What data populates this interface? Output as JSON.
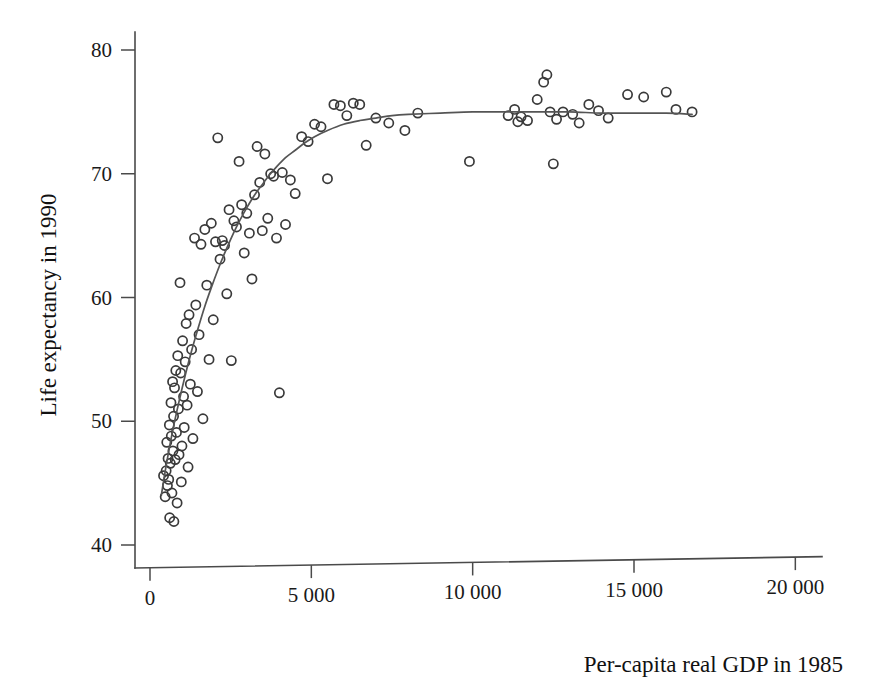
{
  "chart_data": {
    "type": "scatter",
    "title": "",
    "xlabel": "Per-capita real GDP in 1985",
    "ylabel": "Life expectancy in 1990",
    "xlim": [
      0,
      21500
    ],
    "ylim": [
      38.5,
      81.5
    ],
    "xticks": [
      0,
      5000,
      10000,
      15000,
      20000
    ],
    "xticklabels": [
      "0",
      "5 000",
      "10 000",
      "15 000",
      "20 000"
    ],
    "yticks": [
      40,
      50,
      60,
      70,
      80
    ],
    "yticklabels": [
      "40",
      "50",
      "60",
      "70",
      "80"
    ],
    "grid": false,
    "legend": null,
    "marker": "open-circle",
    "point_color": "#3a3a3a",
    "curve_color": "#555555",
    "axis_color": "#4a4a4a",
    "series": [
      {
        "name": "Countries",
        "points": [
          [
            420,
            45.6
          ],
          [
            470,
            43.9
          ],
          [
            500,
            46.0
          ],
          [
            520,
            48.3
          ],
          [
            540,
            44.8
          ],
          [
            560,
            47.0
          ],
          [
            580,
            45.3
          ],
          [
            600,
            49.7
          ],
          [
            610,
            42.2
          ],
          [
            630,
            46.6
          ],
          [
            650,
            51.5
          ],
          [
            660,
            48.8
          ],
          [
            680,
            44.2
          ],
          [
            700,
            53.2
          ],
          [
            710,
            47.6
          ],
          [
            730,
            50.4
          ],
          [
            740,
            41.9
          ],
          [
            760,
            52.7
          ],
          [
            780,
            46.9
          ],
          [
            800,
            54.1
          ],
          [
            820,
            49.1
          ],
          [
            840,
            43.4
          ],
          [
            860,
            55.3
          ],
          [
            880,
            51.0
          ],
          [
            900,
            47.3
          ],
          [
            930,
            61.2
          ],
          [
            950,
            53.9
          ],
          [
            970,
            45.1
          ],
          [
            990,
            48.0
          ],
          [
            1010,
            56.5
          ],
          [
            1040,
            52.0
          ],
          [
            1060,
            49.5
          ],
          [
            1090,
            54.8
          ],
          [
            1120,
            57.9
          ],
          [
            1150,
            51.3
          ],
          [
            1180,
            46.3
          ],
          [
            1210,
            58.6
          ],
          [
            1250,
            53.0
          ],
          [
            1290,
            55.8
          ],
          [
            1330,
            48.6
          ],
          [
            1380,
            64.8
          ],
          [
            1420,
            59.4
          ],
          [
            1470,
            52.4
          ],
          [
            1520,
            57.0
          ],
          [
            1580,
            64.3
          ],
          [
            1640,
            50.2
          ],
          [
            1700,
            65.5
          ],
          [
            1760,
            61.0
          ],
          [
            1830,
            55.0
          ],
          [
            1900,
            66.0
          ],
          [
            1960,
            58.2
          ],
          [
            2030,
            64.5
          ],
          [
            2100,
            72.9
          ],
          [
            2170,
            63.1
          ],
          [
            2240,
            64.6
          ],
          [
            2310,
            64.2
          ],
          [
            2380,
            60.3
          ],
          [
            2450,
            67.1
          ],
          [
            2520,
            54.9
          ],
          [
            2600,
            66.2
          ],
          [
            2680,
            65.7
          ],
          [
            2760,
            71.0
          ],
          [
            2840,
            67.5
          ],
          [
            2920,
            63.6
          ],
          [
            3000,
            66.8
          ],
          [
            3080,
            65.2
          ],
          [
            3160,
            61.5
          ],
          [
            3240,
            68.3
          ],
          [
            3320,
            72.2
          ],
          [
            3400,
            69.3
          ],
          [
            3480,
            65.4
          ],
          [
            3560,
            71.6
          ],
          [
            3650,
            66.4
          ],
          [
            3740,
            70.0
          ],
          [
            3830,
            69.8
          ],
          [
            3920,
            64.8
          ],
          [
            4010,
            52.3
          ],
          [
            4100,
            70.1
          ],
          [
            4200,
            65.9
          ],
          [
            4350,
            69.5
          ],
          [
            4500,
            68.4
          ],
          [
            4700,
            73.0
          ],
          [
            4900,
            72.6
          ],
          [
            5100,
            74.0
          ],
          [
            5300,
            73.8
          ],
          [
            5500,
            69.6
          ],
          [
            5700,
            75.6
          ],
          [
            5900,
            75.5
          ],
          [
            6100,
            74.7
          ],
          [
            6300,
            75.7
          ],
          [
            6500,
            75.6
          ],
          [
            6700,
            72.3
          ],
          [
            7000,
            74.5
          ],
          [
            7400,
            74.1
          ],
          [
            7900,
            73.5
          ],
          [
            8300,
            74.9
          ],
          [
            9900,
            71.0
          ],
          [
            11100,
            74.7
          ],
          [
            11300,
            75.2
          ],
          [
            11400,
            74.2
          ],
          [
            11500,
            74.6
          ],
          [
            11700,
            74.3
          ],
          [
            12000,
            76.0
          ],
          [
            12200,
            77.4
          ],
          [
            12300,
            78.0
          ],
          [
            12400,
            75.0
          ],
          [
            12500,
            70.8
          ],
          [
            12600,
            74.4
          ],
          [
            12800,
            75.0
          ],
          [
            13100,
            74.8
          ],
          [
            13300,
            74.1
          ],
          [
            13600,
            75.6
          ],
          [
            13900,
            75.1
          ],
          [
            14200,
            74.5
          ],
          [
            14800,
            76.4
          ],
          [
            15300,
            76.2
          ],
          [
            16000,
            76.6
          ],
          [
            16300,
            75.2
          ],
          [
            16800,
            75.0
          ]
        ]
      }
    ],
    "fit_curve": {
      "name": "smoothed fit",
      "points": [
        [
          350,
          44.0
        ],
        [
          500,
          46.4
        ],
        [
          700,
          49.2
        ],
        [
          900,
          51.6
        ],
        [
          1100,
          53.8
        ],
        [
          1300,
          55.8
        ],
        [
          1500,
          57.6
        ],
        [
          1700,
          59.3
        ],
        [
          1900,
          60.8
        ],
        [
          2100,
          62.2
        ],
        [
          2300,
          63.5
        ],
        [
          2500,
          64.7
        ],
        [
          2700,
          65.8
        ],
        [
          2900,
          66.8
        ],
        [
          3100,
          67.7
        ],
        [
          3300,
          68.5
        ],
        [
          3500,
          69.2
        ],
        [
          3700,
          69.9
        ],
        [
          3900,
          70.5
        ],
        [
          4200,
          71.3
        ],
        [
          4500,
          71.9
        ],
        [
          4800,
          72.5
        ],
        [
          5100,
          73.0
        ],
        [
          5500,
          73.5
        ],
        [
          6000,
          74.0
        ],
        [
          6500,
          74.3
        ],
        [
          7000,
          74.5
        ],
        [
          7500,
          74.7
        ],
        [
          8000,
          74.8
        ],
        [
          9000,
          74.9
        ],
        [
          10000,
          75.0
        ],
        [
          11000,
          75.0
        ],
        [
          12000,
          75.0
        ],
        [
          13000,
          75.0
        ],
        [
          14000,
          74.9
        ],
        [
          15000,
          74.9
        ],
        [
          16000,
          74.9
        ],
        [
          16800,
          74.8
        ]
      ]
    }
  },
  "axes": {
    "x_title": "Per-capita real GDP in 1985",
    "y_title": "Life expectancy in 1990"
  }
}
